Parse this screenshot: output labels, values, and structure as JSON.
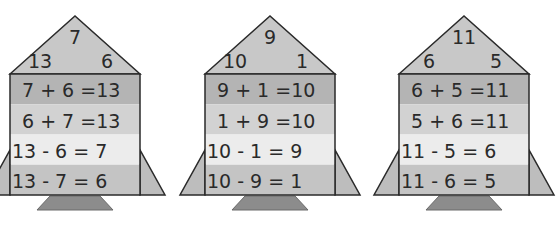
{
  "colors": {
    "roof": "#c8c8c8",
    "band1": "#b4b4b4",
    "band2": "#d2d2d2",
    "band3": "#ececec",
    "band4": "#c4c4c4",
    "fin": "#bdbdbd",
    "base": "#8c8c8c",
    "outline": "#2a2a2a"
  },
  "houses": [
    {
      "roof": {
        "top": "7",
        "left": "13",
        "right": "6"
      },
      "equations": [
        "7 + 6 =13",
        "6 + 7 =13",
        "13 - 6 = 7",
        "13 - 7 = 6"
      ]
    },
    {
      "roof": {
        "top": "9",
        "left": "10",
        "right": "1"
      },
      "equations": [
        "9 + 1 =10",
        "1 + 9 =10",
        "10 - 1 = 9",
        "10 - 9 = 1"
      ]
    },
    {
      "roof": {
        "top": "11",
        "left": "6",
        "right": "5"
      },
      "equations": [
        "6 + 5 =11",
        "5 + 6 =11",
        "11 - 5 = 6",
        "11 - 6 = 5"
      ]
    }
  ]
}
